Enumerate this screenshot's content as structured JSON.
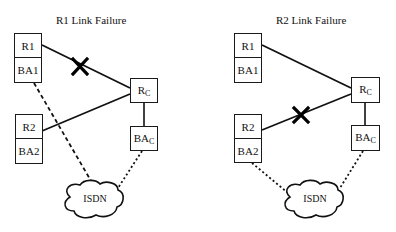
{
  "panels": [
    {
      "title": "R1 Link Failure",
      "failed_link": "R1-Rc",
      "nodes": {
        "r1": "R1",
        "ba1": "BA1",
        "r2": "R2",
        "ba2": "BA2",
        "rc_main": "R",
        "rc_sub": "C",
        "bac_main": "BA",
        "bac_sub": "C",
        "cloud": "ISDN"
      }
    },
    {
      "title": "R2 Link Failure",
      "failed_link": "R2-Rc",
      "nodes": {
        "r1": "R1",
        "ba1": "BA1",
        "r2": "R2",
        "ba2": "BA2",
        "rc_main": "R",
        "rc_sub": "C",
        "bac_main": "BA",
        "bac_sub": "C",
        "cloud": "ISDN"
      }
    }
  ]
}
